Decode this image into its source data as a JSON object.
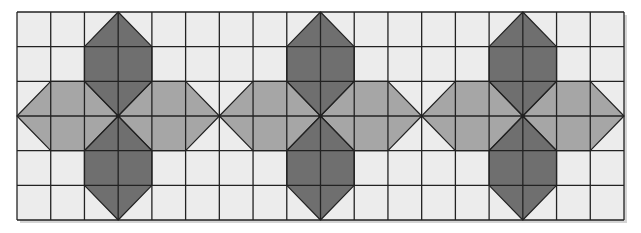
{
  "figure": {
    "grid": {
      "columns": 18,
      "rows": 6,
      "x0": 17,
      "y0": 12,
      "x1": 624,
      "y1": 220
    },
    "colors": {
      "background": "#ececec",
      "light_fill": "#a6a6a6",
      "dark_fill": "#6f6f6f",
      "grid_line": "#222222",
      "shadow": "#d4d4d4"
    },
    "motifs": [
      {
        "center_col": 3,
        "center_row": 3
      },
      {
        "center_col": 9,
        "center_row": 3
      },
      {
        "center_col": 15,
        "center_row": 3
      }
    ]
  }
}
